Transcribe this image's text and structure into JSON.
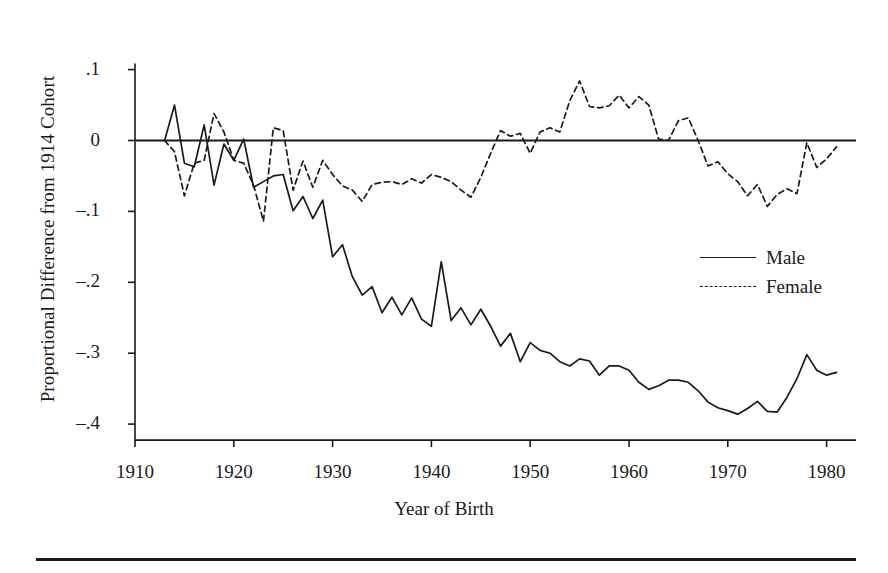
{
  "chart_data": {
    "type": "line",
    "title": "",
    "xlabel": "Year of Birth",
    "ylabel": "Proportional Difference from 1914 Cohort",
    "xlim": [
      1910,
      1982
    ],
    "ylim": [
      -0.43,
      0.12
    ],
    "xticks": [
      1910,
      1920,
      1930,
      1940,
      1950,
      1960,
      1970,
      1980
    ],
    "xtick_labels": [
      "1910",
      "1920",
      "1930",
      "1940",
      "1950",
      "1960",
      "1970",
      "1980"
    ],
    "yticks": [
      0.1,
      0,
      -0.1,
      -0.2,
      -0.3,
      -0.4
    ],
    "ytick_labels": [
      ".1",
      "0",
      "-.1",
      "-.2",
      "-.3",
      "-.4"
    ],
    "grid": false,
    "zero_line": true,
    "legend_position": "right-middle",
    "x": [
      1913,
      1914,
      1915,
      1916,
      1917,
      1918,
      1919,
      1920,
      1921,
      1922,
      1923,
      1924,
      1925,
      1926,
      1927,
      1928,
      1929,
      1930,
      1931,
      1932,
      1933,
      1934,
      1935,
      1936,
      1937,
      1938,
      1939,
      1940,
      1941,
      1942,
      1943,
      1944,
      1945,
      1946,
      1947,
      1948,
      1949,
      1950,
      1951,
      1952,
      1953,
      1954,
      1955,
      1956,
      1957,
      1958,
      1959,
      1960,
      1961,
      1962,
      1963,
      1964,
      1965,
      1966,
      1967,
      1968,
      1969,
      1970,
      1971,
      1972,
      1973,
      1974,
      1975,
      1976,
      1977,
      1978,
      1979,
      1980,
      1981
    ],
    "series": [
      {
        "name": "Male",
        "style": "solid",
        "color": "#1a1a1a",
        "values": [
          0.0,
          0.05,
          -0.032,
          -0.037,
          0.022,
          -0.063,
          -0.005,
          -0.028,
          0.002,
          -0.066,
          -0.058,
          -0.05,
          -0.048,
          -0.099,
          -0.079,
          -0.11,
          -0.084,
          -0.164,
          -0.147,
          -0.192,
          -0.218,
          -0.206,
          -0.243,
          -0.221,
          -0.246,
          -0.222,
          -0.252,
          -0.262,
          -0.171,
          -0.254,
          -0.236,
          -0.26,
          -0.238,
          -0.262,
          -0.29,
          -0.272,
          -0.312,
          -0.285,
          -0.296,
          -0.3,
          -0.312,
          -0.318,
          -0.308,
          -0.311,
          -0.331,
          -0.318,
          -0.318,
          -0.324,
          -0.341,
          -0.351,
          -0.346,
          -0.338,
          -0.338,
          -0.341,
          -0.353,
          -0.369,
          -0.377,
          -0.381,
          -0.386,
          -0.378,
          -0.368,
          -0.382,
          -0.383,
          -0.362,
          -0.336,
          -0.302,
          -0.324,
          -0.331,
          -0.327
        ]
      },
      {
        "name": "Female",
        "style": "dashed",
        "color": "#1a1a1a",
        "values": [
          0.0,
          -0.016,
          -0.078,
          -0.032,
          -0.028,
          0.038,
          0.012,
          -0.028,
          -0.032,
          -0.063,
          -0.114,
          0.018,
          0.014,
          -0.07,
          -0.029,
          -0.066,
          -0.028,
          -0.048,
          -0.064,
          -0.07,
          -0.086,
          -0.062,
          -0.059,
          -0.058,
          -0.062,
          -0.054,
          -0.06,
          -0.048,
          -0.052,
          -0.058,
          -0.07,
          -0.08,
          -0.052,
          -0.018,
          0.014,
          0.006,
          0.01,
          -0.018,
          0.012,
          0.018,
          0.012,
          0.056,
          0.084,
          0.048,
          0.046,
          0.049,
          0.064,
          0.046,
          0.062,
          0.05,
          0.002,
          0.0,
          0.028,
          0.032,
          0.0,
          -0.036,
          -0.03,
          -0.047,
          -0.058,
          -0.078,
          -0.062,
          -0.093,
          -0.076,
          -0.068,
          -0.075,
          -0.003,
          -0.038,
          -0.026,
          -0.009
        ]
      }
    ]
  },
  "legend": {
    "items": [
      {
        "label": "Male",
        "style": "solid"
      },
      {
        "label": "Female",
        "style": "dashed"
      }
    ]
  }
}
